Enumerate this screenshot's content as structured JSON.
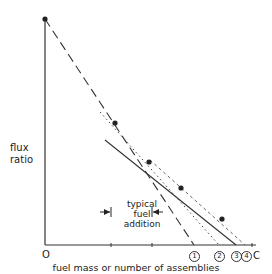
{
  "diagram": {
    "y_axis_label_line1": "flux",
    "y_axis_label_line2": "ratio",
    "x_axis_label": "fuel mass or number of assemblies",
    "origin_label": "O",
    "annotation_line1": "typical",
    "annotation_line2": "fuel",
    "annotation_line3": "addition",
    "x_markers": [
      {
        "label": "1",
        "x": 194
      },
      {
        "label": "2",
        "x": 219
      },
      {
        "label": "3",
        "x": 236
      },
      {
        "label": "4",
        "x": 245
      }
    ],
    "critical_label": "C",
    "data_points": [
      {
        "x": 45,
        "y": 19
      },
      {
        "x": 115,
        "y": 123
      },
      {
        "x": 149,
        "y": 162
      },
      {
        "x": 181,
        "y": 188
      },
      {
        "x": 222,
        "y": 219
      }
    ],
    "lines": {
      "dashed_extrapolation_1": {
        "from": [
          45,
          19
        ],
        "to": [
          194,
          245
        ]
      },
      "dotted_extrapolation_2": {
        "from": [
          100,
          112
        ],
        "to": [
          219,
          245
        ]
      },
      "solid_extrapolation_3": {
        "from": [
          105,
          140
        ],
        "to": [
          236,
          245
        ]
      },
      "thin_dashed_extrapolation_4": {
        "from": [
          150,
          160
        ],
        "to": [
          245,
          245
        ]
      }
    }
  }
}
